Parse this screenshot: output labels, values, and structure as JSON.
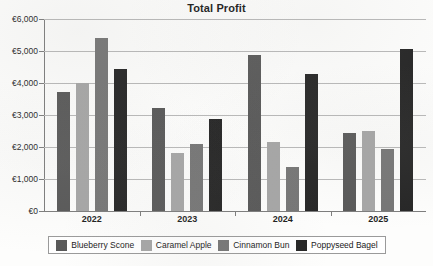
{
  "chart_data": {
    "type": "bar",
    "title": "Total Profit",
    "xlabel": "",
    "ylabel": "",
    "categories": [
      "2022",
      "2023",
      "2024",
      "2025"
    ],
    "series": [
      {
        "name": "Blueberry Scone",
        "color": "#595959",
        "values": [
          3730,
          3220,
          4890,
          2450
        ]
      },
      {
        "name": "Caramel Apple",
        "color": "#a6a6a6",
        "values": [
          3990,
          1820,
          2170,
          2500
        ]
      },
      {
        "name": "Cinnamon Bun",
        "color": "#767676",
        "values": [
          5420,
          2100,
          1380,
          1940
        ]
      },
      {
        "name": "Poppyseed Bagel",
        "color": "#262626",
        "values": [
          4440,
          2870,
          4280,
          5070
        ]
      }
    ],
    "ylim": [
      0,
      6000
    ],
    "ytick_values": [
      0,
      1000,
      2000,
      3000,
      4000,
      5000,
      6000
    ],
    "ytick_labels": [
      "€0",
      "€1,000",
      "€2,000",
      "€3,000",
      "€4,000",
      "€5,000",
      "€6,000"
    ],
    "grid": true,
    "legend_position": "bottom",
    "currency_symbol": "€"
  }
}
